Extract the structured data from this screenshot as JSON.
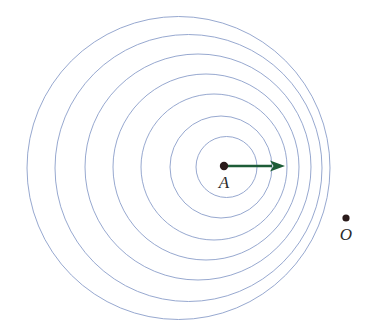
{
  "figure": {
    "kind": "doppler-wavefront-diagram",
    "width": 374,
    "height": 335,
    "background_color": "#ffffff"
  },
  "colors": {
    "wavefront_stroke": "#8b9ec9",
    "source_dot": "#2a1a1a",
    "observer_dot": "#2a1a1a",
    "velocity_arrow": "#1d5c37",
    "label_text": "#2b2b2b"
  },
  "chart_data": {
    "type": "scatter",
    "title": "",
    "xlabel": "",
    "ylabel": "",
    "xlim": [
      0,
      374
    ],
    "ylim": [
      335,
      0
    ],
    "grid": false,
    "legend": null,
    "annotations": [
      {
        "name": "source-label",
        "text": "A",
        "x": 224,
        "y": 184
      },
      {
        "name": "observer-label",
        "text": "O",
        "x": 346,
        "y": 236
      }
    ],
    "points": [
      {
        "name": "source-point",
        "label": "A",
        "x": 224,
        "y": 166,
        "radius": 4.2
      },
      {
        "name": "observer-point",
        "label": "O",
        "x": 346,
        "y": 218,
        "radius": 3.6
      }
    ],
    "vectors": [
      {
        "name": "velocity-vector",
        "from_x": 224,
        "from_y": 166,
        "to_x": 285,
        "to_y": 166,
        "head_length": 15,
        "head_width": 11,
        "stroke_width": 2.4
      }
    ],
    "wavefronts": [
      {
        "index": 1,
        "cx": 226.5,
        "cy": 167,
        "r": 30.5
      },
      {
        "index": 2,
        "cx": 221.0,
        "cy": 167,
        "r": 51.0
      },
      {
        "index": 3,
        "cx": 214.0,
        "cy": 167,
        "r": 73.0
      },
      {
        "index": 4,
        "cx": 206.0,
        "cy": 167,
        "r": 93.0
      },
      {
        "index": 5,
        "cx": 198.0,
        "cy": 167,
        "r": 113.0
      },
      {
        "index": 6,
        "cx": 188.5,
        "cy": 168,
        "r": 133.5
      },
      {
        "index": 7,
        "cx": 178.5,
        "cy": 168,
        "r": 151.5
      }
    ]
  },
  "labels": {
    "source": "A",
    "observer": "O"
  }
}
